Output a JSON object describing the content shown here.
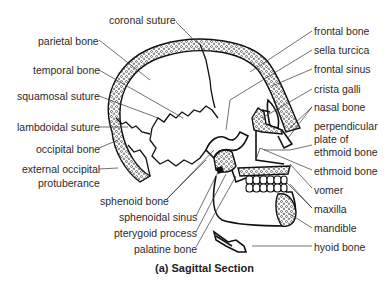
{
  "figure": {
    "caption": "(a) Sagittal Section",
    "labels_left": [
      {
        "id": "coronal-suture",
        "text": "coronal suture"
      },
      {
        "id": "parietal-bone",
        "text": "parietal bone"
      },
      {
        "id": "temporal-bone",
        "text": "temporal bone"
      },
      {
        "id": "squamosal-suture",
        "text": "squamosal suture"
      },
      {
        "id": "lambdoidal-suture",
        "text": "lambdoidal suture"
      },
      {
        "id": "occipital-bone",
        "text": "occipital bone"
      },
      {
        "id": "external-occipital-protuberance",
        "text_line1": "external occipital",
        "text_line2": "protuberance"
      },
      {
        "id": "sphenoid-bone",
        "text": "sphenoid bone"
      },
      {
        "id": "sphenoidal-sinus",
        "text": "sphenoidal sinus"
      },
      {
        "id": "pterygoid-process",
        "text": "pterygoid process"
      },
      {
        "id": "palatine-bone",
        "text": "palatine bone"
      }
    ],
    "labels_right": [
      {
        "id": "frontal-bone",
        "text": "frontal bone"
      },
      {
        "id": "sella-turcica",
        "text": "sella turcica"
      },
      {
        "id": "frontal-sinus",
        "text": "frontal sinus"
      },
      {
        "id": "crista-galli",
        "text": "crista galli"
      },
      {
        "id": "nasal-bone",
        "text": "nasal bone"
      },
      {
        "id": "perpendicular-plate",
        "text_line1": "perpendicular",
        "text_line2": "plate of",
        "text_line3": "ethmoid bone"
      },
      {
        "id": "ethmoid-bone",
        "text": "ethmoid bone"
      },
      {
        "id": "vomer",
        "text": "vomer"
      },
      {
        "id": "maxilla",
        "text": "maxilla"
      },
      {
        "id": "mandible",
        "text": "mandible"
      },
      {
        "id": "hyoid-bone",
        "text": "hyoid bone"
      }
    ]
  }
}
